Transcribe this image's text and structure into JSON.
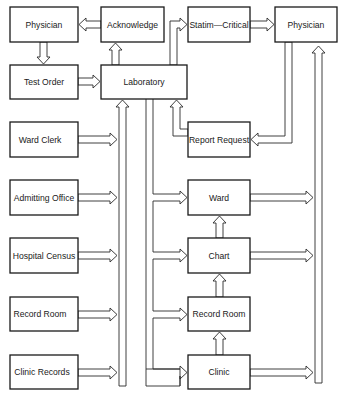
{
  "diagram": {
    "type": "flowchart",
    "title": "",
    "nodes": {
      "physician_left": {
        "label": "Physician"
      },
      "acknowledge": {
        "label": "Acknowledge"
      },
      "statim_critical": {
        "label": "Statim—Critical"
      },
      "physician_right": {
        "label": "Physician"
      },
      "test_order": {
        "label": "Test Order"
      },
      "laboratory": {
        "label": "Laboratory"
      },
      "report_request": {
        "label": "Report Request"
      },
      "ward_clerk": {
        "label": "Ward Clerk"
      },
      "ward": {
        "label": "Ward"
      },
      "admitting_office": {
        "label": "Admitting Office"
      },
      "chart": {
        "label": "Chart"
      },
      "hospital_census": {
        "label": "Hospital Census"
      },
      "record_room_left": {
        "label": "Record Room"
      },
      "record_room_right": {
        "label": "Record Room"
      },
      "clinic_records": {
        "label": "Clinic Records"
      },
      "clinic": {
        "label": "Clinic"
      }
    },
    "edges": [
      {
        "from": "Acknowledge",
        "to": "Physician (left)"
      },
      {
        "from": "Physician (left)",
        "to": "Test Order"
      },
      {
        "from": "Test Order",
        "to": "Laboratory"
      },
      {
        "from": "Laboratory",
        "to": "Acknowledge"
      },
      {
        "from": "Laboratory",
        "to": "Statim—Critical"
      },
      {
        "from": "Statim—Critical",
        "to": "Physician (right)"
      },
      {
        "from": "Physician (right)",
        "to": "Report Request"
      },
      {
        "from": "Report Request",
        "to": "Laboratory"
      },
      {
        "from": "Ward Clerk",
        "to": "Laboratory"
      },
      {
        "from": "Admitting Office",
        "to": "Laboratory"
      },
      {
        "from": "Hospital Census",
        "to": "Laboratory"
      },
      {
        "from": "Record Room (left)",
        "to": "Laboratory"
      },
      {
        "from": "Clinic Records",
        "to": "Laboratory"
      },
      {
        "from": "Laboratory",
        "to": "Ward"
      },
      {
        "from": "Laboratory",
        "to": "Chart"
      },
      {
        "from": "Laboratory",
        "to": "Record Room (right)"
      },
      {
        "from": "Laboratory",
        "to": "Clinic"
      },
      {
        "from": "Chart",
        "to": "Ward"
      },
      {
        "from": "Record Room (right)",
        "to": "Chart"
      },
      {
        "from": "Clinic",
        "to": "Record Room (right)"
      },
      {
        "from": "Ward",
        "to": "Physician (right)"
      },
      {
        "from": "Chart",
        "to": "Physician (right)"
      },
      {
        "from": "Clinic",
        "to": "Physician (right)"
      }
    ],
    "colors": {
      "line": "#1a1a1a",
      "background": "#ffffff"
    }
  }
}
